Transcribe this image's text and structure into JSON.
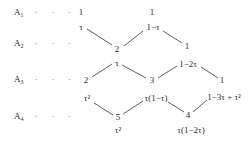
{
  "rows": [
    {
      "label": "A",
      "subscript": "1",
      "dots": "· · ·"
    },
    {
      "label": "A",
      "subscript": "2",
      "dots": "· · ·"
    },
    {
      "label": "A",
      "subscript": "3",
      "dots": "· · ·"
    },
    {
      "label": "A",
      "subscript": "4",
      "dots": "· · ·"
    }
  ],
  "nodes": {
    "r1_left": "1",
    "r1_right": "1",
    "e_tau_1": "τ",
    "e_1mtau": "1−τ",
    "r2_mid": "2",
    "r2_right": "1",
    "e_tau_2": "τ",
    "e_1m2tau": "1−2τ",
    "r3_left": "2",
    "r3_mid": "3",
    "r3_right": "1",
    "e_tau2_left": "τ²",
    "e_tau1mtau": "τ(1−τ)",
    "e_1m3tau": "1−3τ + τ²",
    "r4_left": "5",
    "r4_right": "4",
    "below_5": "τ²",
    "below_4": "τ(1−2τ)"
  },
  "edges": [
    {
      "from": "r1_left",
      "to": "r2_mid",
      "weight": "τ"
    },
    {
      "from": "r2_mid",
      "to": "r1_right",
      "weight": "1−τ"
    },
    {
      "from": "r1_right",
      "to": "r2_right",
      "weight": "1−τ"
    },
    {
      "from": "r3_left",
      "to": "r2_mid",
      "weight": "τ"
    },
    {
      "from": "r2_mid",
      "to": "r3_mid",
      "weight": "τ"
    },
    {
      "from": "r3_mid",
      "to": "r2_right",
      "weight": "1−2τ"
    },
    {
      "from": "r2_right",
      "to": "r3_right",
      "weight": "1−2τ"
    },
    {
      "from": "r3_left",
      "to": "r4_left",
      "weight": "τ²"
    },
    {
      "from": "r4_left",
      "to": "r3_mid",
      "weight": "τ(1−τ)"
    },
    {
      "from": "r3_mid",
      "to": "r4_right",
      "weight": "τ(1−τ)"
    },
    {
      "from": "r4_right",
      "to": "r3_right",
      "weight": "1−3τ + τ²"
    }
  ]
}
